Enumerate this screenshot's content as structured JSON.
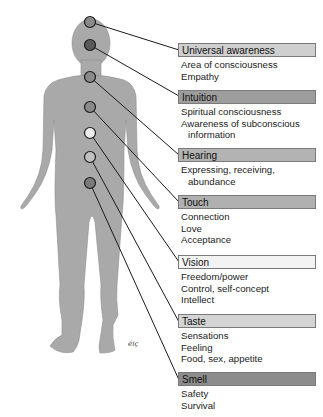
{
  "figure": {
    "type": "chakra-body-diagram",
    "signature": "éiç",
    "colors": {
      "body": "#a9a9a9",
      "line": "#1a1a1a"
    }
  },
  "chakras": [
    {
      "id": "universal-awareness",
      "label": "Universal awareness",
      "box_color": "#cfcfcf",
      "dot_color": "#8a8a8a",
      "dot": {
        "x": 90,
        "y": 22
      },
      "descriptions": [
        "Area of consciousness",
        "Empathy"
      ]
    },
    {
      "id": "intuition",
      "label": "Intuition",
      "box_color": "#9d9d9d",
      "dot_color": "#5a5a5a",
      "dot": {
        "x": 90,
        "y": 45
      },
      "descriptions": [
        "Spiritual consciousness",
        "Awareness of subconscious",
        "information"
      ]
    },
    {
      "id": "hearing",
      "label": "Hearing",
      "box_color": "#b3b3b3",
      "dot_color": "#8a8a8a",
      "dot": {
        "x": 90,
        "y": 77
      },
      "descriptions": [
        "Expressing, receiving,",
        "abundance"
      ]
    },
    {
      "id": "touch",
      "label": "Touch",
      "box_color": "#b0b0b0",
      "dot_color": "#8a8a8a",
      "dot": {
        "x": 90,
        "y": 107
      },
      "descriptions": [
        "Connection",
        "Love",
        "Acceptance"
      ]
    },
    {
      "id": "vision",
      "label": "Vision",
      "box_color": "#f3f3f3",
      "dot_color": "#ececec",
      "dot": {
        "x": 90,
        "y": 133
      },
      "descriptions": [
        "Freedom/power",
        "Control, self-concept",
        "Intellect"
      ]
    },
    {
      "id": "taste",
      "label": "Taste",
      "box_color": "#d4d4d4",
      "dot_color": "#c0c0c0",
      "dot": {
        "x": 90,
        "y": 157
      },
      "descriptions": [
        "Sensations",
        "Feeling",
        "Food, sex, appetite"
      ]
    },
    {
      "id": "smell",
      "label": "Smell",
      "box_color": "#8c8c8c",
      "dot_color": "#7a7a7a",
      "dot": {
        "x": 90,
        "y": 183
      },
      "descriptions": [
        "Safety",
        "Survival"
      ]
    }
  ]
}
